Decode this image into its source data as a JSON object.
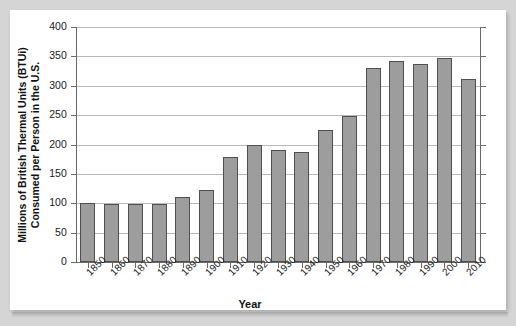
{
  "chart_data": {
    "type": "bar",
    "title": "",
    "xlabel": "Year",
    "ylabel_line1": "Millions of British Thermal Units (BTUi)",
    "ylabel_line2": "Consumed per Person in the U.S.",
    "categories": [
      "1850",
      "1860",
      "1870",
      "1880",
      "1890",
      "1900",
      "1910",
      "1920",
      "1930",
      "1940",
      "1950",
      "1960",
      "1970",
      "1980",
      "1990",
      "2000",
      "2010"
    ],
    "values": [
      101,
      99,
      99,
      99,
      111,
      123,
      178,
      200,
      190,
      188,
      225,
      249,
      331,
      343,
      337,
      348,
      312
    ],
    "ylim": [
      0,
      400
    ],
    "yticks": [
      0,
      50,
      100,
      150,
      200,
      250,
      300,
      350,
      400
    ],
    "ytick_labels": [
      "0",
      "50",
      "100",
      "150",
      "200",
      "250",
      "300",
      "350",
      "400"
    ],
    "grid": true,
    "legend": "none",
    "bar_color": "#9d9d9d",
    "bar_edge_color": "#4f4f4f",
    "gridline_color": "#b9b9b9",
    "axis_color": "#6a6a6a",
    "plot_background": "#ffffff",
    "page_background": "#d5d5d5"
  }
}
